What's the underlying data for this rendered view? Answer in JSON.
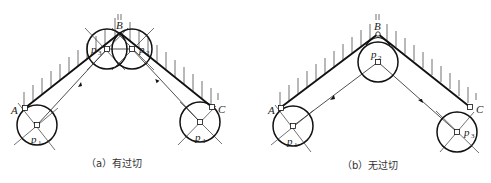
{
  "figure": {
    "panel_a": {
      "caption": "（a）有过切",
      "points": {
        "A": "A",
        "B": "B",
        "C": "C"
      },
      "circles": [
        {
          "label": "p",
          "sub": "1"
        },
        {
          "label": "p",
          "sub": "3"
        },
        {
          "label": "p",
          "sub": "2"
        },
        {
          "label": "p",
          "sub": "4"
        }
      ]
    },
    "panel_b": {
      "caption": "（b）无过切",
      "points": {
        "A": "A",
        "B": "B",
        "C": "C"
      },
      "circles": [
        {
          "label": "p",
          "sub": "1"
        },
        {
          "label": "p",
          "sub": "2"
        },
        {
          "label": "p",
          "sub": "3"
        }
      ]
    },
    "colors": {
      "line": "#111111",
      "background": "#ffffff"
    }
  }
}
